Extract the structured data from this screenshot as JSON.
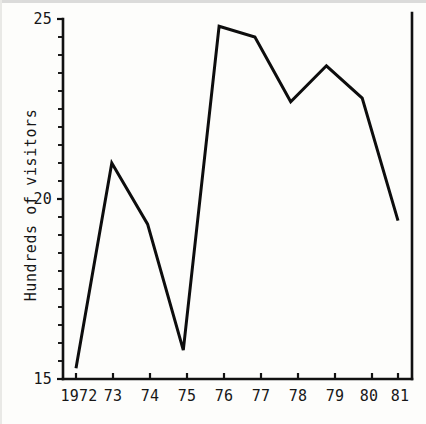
{
  "chart_data": {
    "type": "line",
    "title": "",
    "xlabel": "",
    "ylabel": "Hundreds of visitors",
    "categories": [
      "1972",
      "73",
      "74",
      "75",
      "76",
      "77",
      "78",
      "79",
      "80",
      "81"
    ],
    "x_tick_labels": [
      "1972",
      "73",
      "74",
      "75",
      "76",
      "77",
      "78",
      "79",
      "80",
      "81"
    ],
    "values": [
      15.3,
      21.0,
      19.3,
      15.8,
      24.8,
      24.5,
      22.7,
      23.7,
      22.8,
      19.4
    ],
    "series": [
      {
        "name": "Visitors",
        "values": [
          15.3,
          21.0,
          19.3,
          15.8,
          24.8,
          24.5,
          22.7,
          23.7,
          22.8,
          19.4
        ]
      }
    ],
    "y_tick_labels": [
      "15",
      "20",
      "25"
    ],
    "y_tick_values": [
      15,
      20,
      25
    ],
    "y_minor_tick_step": 0.5,
    "ylim": [
      15,
      25
    ],
    "xlim": [
      "1972",
      "81"
    ],
    "grid": false,
    "legend": false,
    "legend_position": "none",
    "line_color": "#0d0d0d",
    "axis_color": "#111111",
    "background_color": "#fdfdfb",
    "annotations": []
  },
  "axes": {
    "y_title": "Hundreds of visitors",
    "y_labels": [
      {
        "text": "25",
        "value": 25
      },
      {
        "text": "20",
        "value": 20
      },
      {
        "text": "15",
        "value": 15
      }
    ],
    "x_labels": [
      {
        "text": "1972",
        "value": 1972
      },
      {
        "text": "73",
        "value": 1973
      },
      {
        "text": "74",
        "value": 1974
      },
      {
        "text": "75",
        "value": 1975
      },
      {
        "text": "76",
        "value": 1976
      },
      {
        "text": "77",
        "value": 1977
      },
      {
        "text": "78",
        "value": 1978
      },
      {
        "text": "79",
        "value": 1979
      },
      {
        "text": "80",
        "value": 1980
      },
      {
        "text": "81",
        "value": 1981
      }
    ]
  }
}
